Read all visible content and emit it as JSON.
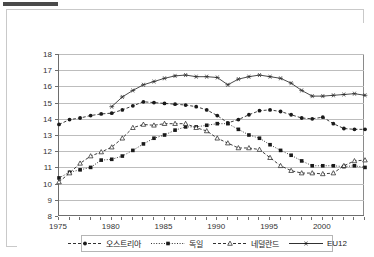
{
  "chart_data": {
    "type": "line",
    "title": "",
    "subtitle": "",
    "xlabel": "",
    "ylabel": "",
    "xlim": [
      1975,
      2004
    ],
    "ylim": [
      8,
      18
    ],
    "grid": true,
    "legend_position": "bottom",
    "x": [
      1975,
      1976,
      1977,
      1978,
      1979,
      1980,
      1981,
      1982,
      1983,
      1984,
      1985,
      1986,
      1987,
      1988,
      1989,
      1990,
      1991,
      1992,
      1993,
      1994,
      1995,
      1996,
      1997,
      1998,
      1999,
      2000,
      2001,
      2002,
      2003,
      2004
    ],
    "y_ticks": [
      8,
      9,
      10,
      11,
      12,
      13,
      14,
      15,
      16,
      17,
      18
    ],
    "x_ticks_labeled": [
      1975,
      1980,
      1985,
      1990,
      1995,
      2000
    ],
    "series": [
      {
        "name": "오스트리아",
        "marker": "filled-circle",
        "dash": "dashed",
        "color": "#1a1a1a",
        "values": [
          13.65,
          13.95,
          14.05,
          14.2,
          14.3,
          14.35,
          14.55,
          14.8,
          15.05,
          15.0,
          14.95,
          14.9,
          14.85,
          14.75,
          14.55,
          14.2,
          13.75,
          13.95,
          14.25,
          14.5,
          14.55,
          14.45,
          14.25,
          14.05,
          14.0,
          14.1,
          13.7,
          13.4,
          13.35,
          13.35
        ]
      },
      {
        "name": "독일",
        "marker": "filled-square",
        "dash": "dotted",
        "color": "#1a1a1a",
        "values": [
          10.35,
          10.7,
          10.85,
          11.0,
          11.45,
          11.5,
          11.7,
          12.05,
          12.45,
          12.8,
          13.0,
          13.3,
          13.5,
          13.5,
          13.6,
          13.7,
          13.7,
          13.35,
          13.0,
          12.8,
          12.4,
          12.05,
          11.75,
          11.4,
          11.1,
          11.1,
          11.1,
          11.05,
          11.1,
          11.0
        ]
      },
      {
        "name": "네덜란드",
        "marker": "open-triangle",
        "dash": "dashed",
        "color": "#1a1a1a",
        "values": [
          10.1,
          10.65,
          11.25,
          11.7,
          11.95,
          12.25,
          12.8,
          13.45,
          13.65,
          13.6,
          13.7,
          13.7,
          13.7,
          13.45,
          13.25,
          12.8,
          12.5,
          12.2,
          12.2,
          12.1,
          11.6,
          11.1,
          10.8,
          10.65,
          10.65,
          10.6,
          10.65,
          11.1,
          11.4,
          11.45
        ]
      },
      {
        "name": "EU12",
        "marker": "star",
        "dash": "solid",
        "color": "#2b2b2b",
        "values": [
          null,
          null,
          null,
          null,
          null,
          14.75,
          15.35,
          15.75,
          16.1,
          16.3,
          16.5,
          16.65,
          16.7,
          16.6,
          16.6,
          16.55,
          16.1,
          16.45,
          16.6,
          16.7,
          16.6,
          16.5,
          16.2,
          15.75,
          15.4,
          15.4,
          15.45,
          15.5,
          15.55,
          15.45
        ]
      }
    ],
    "legend": [
      {
        "label": "오스트리아",
        "marker": "filled-circle",
        "dash": "dashed"
      },
      {
        "label": "독일",
        "marker": "filled-square",
        "dash": "dotted"
      },
      {
        "label": "네덜란드",
        "marker": "open-triangle",
        "dash": "dashed"
      },
      {
        "label": "EU12",
        "marker": "star",
        "dash": "solid"
      }
    ]
  }
}
